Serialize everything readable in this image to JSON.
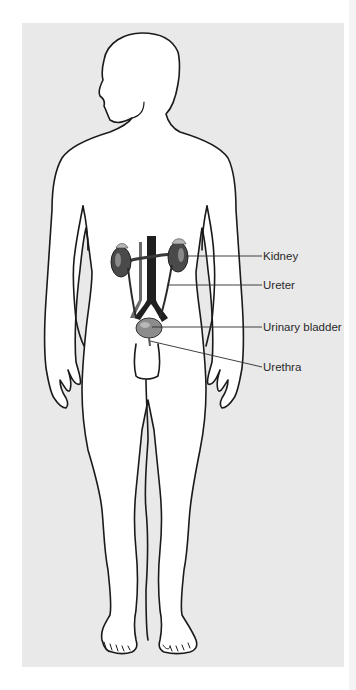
{
  "figure": {
    "background_color": "#e9e9e9",
    "outline_color": "#1a1a1a",
    "organ_color": "#5a5a5a"
  },
  "labels": [
    {
      "id": "kidney",
      "text": "Kidney",
      "y": 250
    },
    {
      "id": "ureter",
      "text": "Ureter",
      "y": 279
    },
    {
      "id": "urinary-bladder",
      "text": "Urinary bladder",
      "y": 321
    },
    {
      "id": "urethra",
      "text": "Urethra",
      "y": 361
    }
  ]
}
